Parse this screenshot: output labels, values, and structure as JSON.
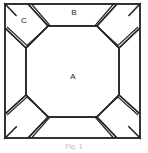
{
  "figure": {
    "caption": "Fig. 1",
    "background_color": "#ffffff",
    "stroke_color": "#262626",
    "fill_color": "#ffffff",
    "label_color": "#1a1a1a",
    "stroke_width": 1.4
  },
  "labels": {
    "center": "A",
    "edge": "B",
    "corner": "C"
  },
  "regions": [
    {
      "id": "center-octagon",
      "label": "A",
      "role": "central octagonal panel",
      "label_x": 73,
      "label_y": 77
    },
    {
      "id": "top-edge-flap",
      "label": "B",
      "role": "top trapezoidal edge flap",
      "label_x": 74,
      "label_y": 13
    },
    {
      "id": "top-left-corner-flap",
      "label": "C",
      "role": "top-left corner flap",
      "label_x": 24,
      "label_y": 21
    },
    {
      "id": "right-edge-flap",
      "label": "",
      "role": "right trapezoidal edge flap",
      "label_x": 0,
      "label_y": 0
    },
    {
      "id": "bottom-edge-flap",
      "label": "",
      "role": "bottom trapezoidal edge flap",
      "label_x": 0,
      "label_y": 0
    },
    {
      "id": "left-edge-flap",
      "label": "",
      "role": "left trapezoidal edge flap",
      "label_x": 0,
      "label_y": 0
    },
    {
      "id": "top-right-corner-flap",
      "label": "",
      "role": "top-right corner flap",
      "label_x": 0,
      "label_y": 0
    },
    {
      "id": "bottom-right-corner-flap",
      "label": "",
      "role": "bottom-right corner flap",
      "label_x": 0,
      "label_y": 0
    },
    {
      "id": "bottom-left-corner-flap",
      "label": "",
      "role": "bottom-left corner flap",
      "label_x": 0,
      "label_y": 0
    }
  ],
  "geometry": {
    "frame": {
      "left": 5,
      "top": 4,
      "right": 140,
      "bottom": 138
    },
    "octagon_points": "48,26 97,26 119,48 119,95 97,117 48,117 26,95 26,48",
    "paths": {
      "outer_frame_top": "M5,4 L140,4",
      "outer_frame_right": "M140,4 L140,138",
      "outer_frame_bottom": "M140,138 L5,138",
      "outer_frame_left": "M5,138 L5,4",
      "top_flap": "M5,4 L140,4 L119,26 L26,26 Z",
      "right_flap": "M140,4 L140,138 L119,117 L119,26 Z",
      "bottom_flap": "M140,138 L5,138 L26,117 L119,117 Z",
      "left_flap": "M5,138 L5,4 L26,26 L26,117 Z",
      "corner_tl_outer": "M28,4 L48,26 L26,48 L5,28",
      "corner_tr_outer": "M117,4 L97,26 L119,48 L140,28",
      "corner_br_outer": "M117,138 L97,117 L119,95 L140,114",
      "corner_bl_outer": "M28,138 L48,117 L26,95 L5,114",
      "corner_tl_inner": "M31,5 L49,25 L27,45 L7,27",
      "corner_tr_inner": "M114,5 L96,25 L118,45 L138,27",
      "corner_br_inner": "M114,137 L96,117 L118,97 L138,115",
      "corner_bl_inner": "M31,137 L49,117 L27,97 L7,115"
    }
  }
}
